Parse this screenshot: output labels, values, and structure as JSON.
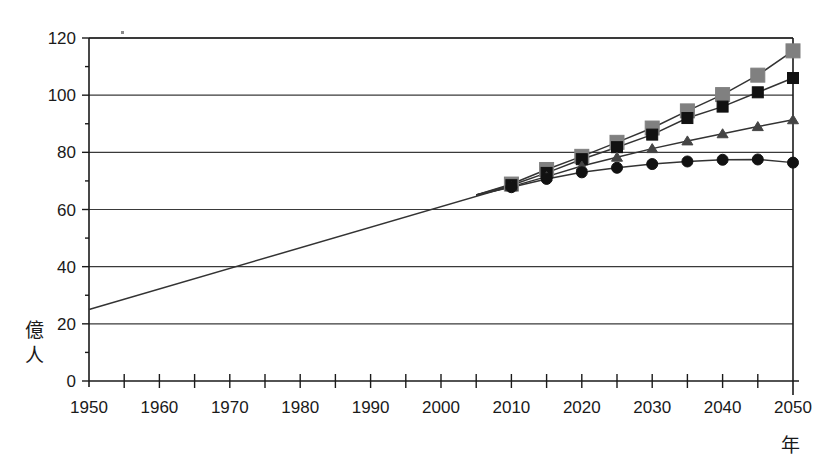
{
  "chart_data": {
    "type": "line",
    "title": "",
    "subtitle": "",
    "xlabel": "年",
    "ylabel": "億人",
    "xlim": [
      1950,
      2050
    ],
    "ylim": [
      0,
      120
    ],
    "grid": true,
    "grid_axis": "y",
    "legend": "none",
    "x_tick_interval": 5,
    "x_label_interval": 10,
    "y_tick_interval": 20,
    "x_ticklabels": [
      "1950",
      "1960",
      "1970",
      "1980",
      "1990",
      "2000",
      "2010",
      "2020",
      "2030",
      "2040",
      "2050"
    ],
    "y_ticklabels": [
      "0",
      "20",
      "40",
      "60",
      "80",
      "100",
      "120"
    ],
    "x": [
      1950,
      1955,
      1960,
      1965,
      1970,
      1975,
      1980,
      1985,
      1990,
      1995,
      2000,
      2005,
      2010,
      2015,
      2020,
      2025,
      2030,
      2035,
      2040,
      2045,
      2050
    ],
    "series": [
      {
        "name": "high-variant",
        "marker": "gray-square",
        "color": "#808080",
        "line_color": "#333333",
        "values": [
          25.0,
          27.7,
          30.3,
          33.3,
          36.9,
          40.7,
          44.5,
          48.5,
          52.8,
          57.1,
          61.2,
          65.1,
          68.9,
          74.0,
          78.6,
          83.5,
          88.5,
          94.5,
          100.2,
          107.0,
          115.5
        ]
      },
      {
        "name": "medium-variant",
        "marker": "black-square",
        "color": "#111111",
        "line_color": "#333333",
        "values": [
          25.0,
          27.7,
          30.3,
          33.3,
          36.9,
          40.7,
          44.5,
          48.5,
          52.8,
          57.1,
          61.2,
          65.1,
          68.5,
          72.8,
          77.6,
          81.8,
          86.2,
          92.0,
          96.0,
          101.0,
          106.0
        ]
      },
      {
        "name": "low-variant",
        "marker": "triangle",
        "color": "#444444",
        "line_color": "#333333",
        "values": [
          25.0,
          27.7,
          30.3,
          33.3,
          36.9,
          40.7,
          44.5,
          48.5,
          52.8,
          57.1,
          61.2,
          65.1,
          68.0,
          71.5,
          75.2,
          78.3,
          81.3,
          84.0,
          86.5,
          89.0,
          91.4
        ]
      },
      {
        "name": "constant-fertility-low",
        "marker": "black-circle",
        "color": "#111111",
        "line_color": "#333333",
        "values": [
          25.0,
          27.7,
          30.3,
          33.3,
          36.9,
          40.7,
          44.5,
          48.5,
          52.8,
          57.1,
          61.2,
          65.1,
          67.8,
          70.7,
          73.0,
          74.6,
          75.9,
          76.8,
          77.4,
          77.5,
          76.4
        ]
      }
    ],
    "marker_start_year": 2010,
    "historical_line": {
      "name": "historical-and-estimate",
      "start": {
        "year": 1950,
        "value": 25.0
      },
      "end": {
        "year": 2010,
        "value": 68.2
      }
    },
    "annotations": [
      {
        "name": "stray-ink-speck",
        "x": 122,
        "y": 32
      }
    ]
  },
  "plot": {
    "left": 89,
    "right": 793,
    "top": 38,
    "bottom": 381
  }
}
